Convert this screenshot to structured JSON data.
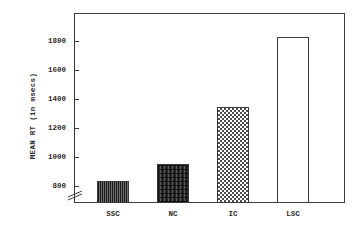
{
  "chart_data": {
    "type": "bar",
    "title": "",
    "subtitle": "",
    "xlabel": "",
    "ylabel": "MEAN RT (in msecs)",
    "categories": [
      "SSC",
      "NC",
      "IC",
      "LSC"
    ],
    "values": [
      870,
      970,
      1310,
      1730
    ],
    "series": [
      {
        "name": "Mean RT",
        "values": [
          870,
          970,
          1310,
          1730
        ]
      }
    ],
    "ylim": [
      740,
      1870
    ],
    "yticks": [
      800,
      1000,
      1200,
      1400,
      1600,
      1800
    ],
    "ytick_labels": [
      "800",
      "1000",
      "1200",
      "1400",
      "1600",
      "1800"
    ],
    "axis_break": true,
    "axis_break_note": "y-axis broken below 800",
    "grid": false,
    "legend": false,
    "legend_position": "none",
    "bar_fills": [
      "vertical-dark",
      "crosshatch-dark",
      "checker-light",
      "empty"
    ],
    "colors": {
      "axis": "#3a3a3a",
      "text": "#2b2b2b",
      "background": "#ffffff",
      "bar_ssc": "#4a4a4a",
      "bar_nc": "#3f3f3f",
      "bar_ic": "#9a9a9a",
      "bar_lsc": "#ffffff"
    }
  }
}
